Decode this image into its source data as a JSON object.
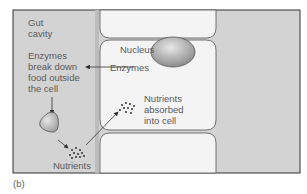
{
  "figure": {
    "panel_label": "(b)",
    "labels": {
      "gut_cavity_line1": "Gut",
      "gut_cavity_line2": "cavity",
      "enzymes_break_1": "Enzymes",
      "enzymes_break_2": "break down",
      "enzymes_break_3": "food outside",
      "enzymes_break_4": "the cell",
      "nucleus": "Nucleus",
      "enzymes": "Enzymes",
      "absorbed_1": "Nutrients",
      "absorbed_2": "absorbed",
      "absorbed_3": "into cell",
      "nutrients": "Nutrients"
    },
    "colors": {
      "cavity": "#d3d3d3",
      "cell": "#f4f4f4",
      "outline": "#555555",
      "text": "#5a5a5a",
      "nucleus": "#b0b0b0"
    }
  }
}
